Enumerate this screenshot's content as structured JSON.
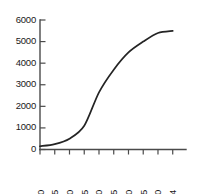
{
  "chart_data": {
    "type": "line",
    "title": "",
    "subtitle": "",
    "xlabel": "",
    "ylabel": "",
    "x": [
      1950,
      1955,
      1960,
      1965,
      1970,
      1975,
      1980,
      1985,
      1990,
      1994
    ],
    "values": [
      150,
      250,
      500,
      1100,
      2650,
      3700,
      4500,
      5000,
      5400,
      5500
    ],
    "categories": [
      "1950",
      "1955",
      "1960",
      "1965",
      "1970",
      "1975",
      "1980",
      "1985",
      "1990",
      "1994"
    ],
    "series": [
      {
        "name": "",
        "values": [
          150,
          250,
          500,
          1100,
          2650,
          3700,
          4500,
          5000,
          5400,
          5500
        ]
      }
    ],
    "xlim": [
      1950,
      1994
    ],
    "ylim": [
      0,
      6000
    ],
    "ytick_labels": [
      "0",
      "1000",
      "2000",
      "3000",
      "4000",
      "5000",
      "6000"
    ],
    "ytick_values": [
      0,
      1000,
      2000,
      3000,
      4000,
      5000,
      6000
    ],
    "xtick_labels": [
      "1950",
      "1955",
      "1960",
      "1965",
      "1970",
      "1975",
      "1980",
      "1985",
      "1990",
      "1994"
    ],
    "grid": false,
    "legend": false,
    "legend_position": "none",
    "annotations": [],
    "line_color": "#242424",
    "axis_color": "#4a4a4a",
    "background_color": "#ffffff"
  }
}
